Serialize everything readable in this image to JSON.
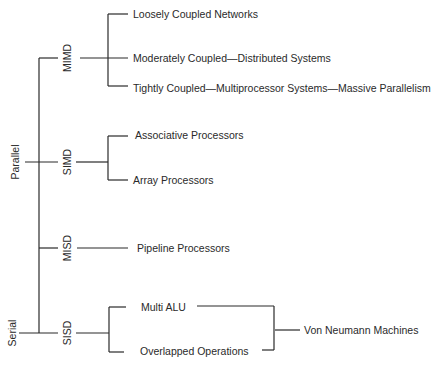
{
  "root": {
    "parallel_label": "Parallel",
    "serial_label": "Serial"
  },
  "classes": {
    "mimd": {
      "label": "MIMD",
      "children": [
        "Loosely Coupled Networks",
        "Moderately Coupled—Distributed Systems",
        "Tightly Coupled—Multiprocessor Systems—Massive Parallelism"
      ]
    },
    "simd": {
      "label": "SIMD",
      "children": [
        "Associative Processors",
        "Array Processors"
      ]
    },
    "misd": {
      "label": "MISD",
      "children": [
        "Pipeline Processors"
      ]
    },
    "sisd": {
      "label": "SISD",
      "children": [
        "Multi ALU",
        "Overlapped Operations"
      ],
      "merged_into": "Von Neumann Machines"
    }
  },
  "colors": {
    "line": "#2a2a2a",
    "background": "#ffffff"
  }
}
